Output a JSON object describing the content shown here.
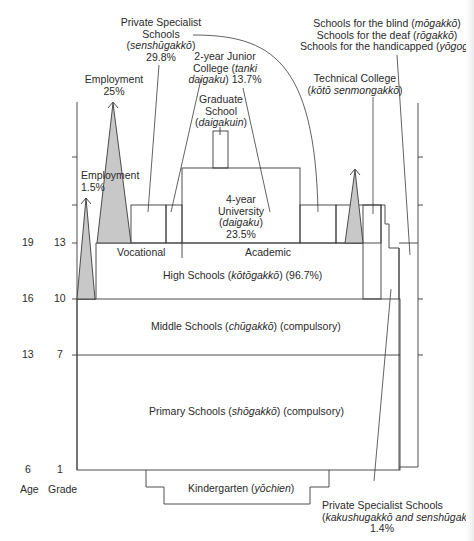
{
  "diagram": {
    "axis": {
      "age_label": "Age",
      "grade_label": "Grade",
      "rows": [
        {
          "age": "19",
          "grade": "13"
        },
        {
          "age": "16",
          "grade": "10"
        },
        {
          "age": "13",
          "grade": "7"
        },
        {
          "age": "6",
          "grade": "1"
        }
      ]
    },
    "labels": {
      "private_specialist_top": {
        "line1": "Private Specialist",
        "line2": "Schools",
        "line3_pre": "(",
        "line3_it": "senshūgakkō",
        "line3_post": ")",
        "line4": "29.8%"
      },
      "junior_college": {
        "line1": "2-year Junior",
        "line2_pre": "College (",
        "line2_it": "tanki",
        "line3_it": "daigaku",
        "line3_post": ") 13.7%"
      },
      "graduate_school": {
        "line1": "Graduate",
        "line2": "School",
        "line3_pre": "(",
        "line3_it": "daigakuin",
        "line3_post": ")"
      },
      "employment_25": {
        "line1": "Employment",
        "line2": "25%"
      },
      "employment_1_5": {
        "line1": "Employment",
        "line2": "1.5%"
      },
      "university": {
        "line1": "4-year",
        "line2": "University",
        "line3_pre": "(",
        "line3_it": "daigaku",
        "line3_post": ")",
        "line4": "23.5%"
      },
      "special_schools": {
        "blind_pre": "Schools for the blind (",
        "blind_it": "mōgakkō",
        "blind_post": ")",
        "deaf_pre": "Schools for the deaf (",
        "deaf_it": "rōgakkō",
        "deaf_post": ")",
        "handicapped_pre": "Schools for the handicapped (",
        "handicapped_it": "yōgogakkō",
        "handicapped_post": ")"
      },
      "technical_college": {
        "line1": "Technical College",
        "line2_pre": "(",
        "line2_it": "kōtō senmongakkō",
        "line2_post": ")"
      },
      "vocational": "Vocational",
      "academic": "Academic",
      "high_schools": {
        "pre": "High Schools (",
        "it": "kōtōgakkō",
        "post": ") (96.7%)"
      },
      "middle_schools": {
        "pre": "Middle Schools (",
        "it": "chūgakkō",
        "post": ") (compulsory)"
      },
      "primary_schools": {
        "pre": "Primary Schools (",
        "it": "shōgakkō",
        "post": ") (compulsory)"
      },
      "kindergarten": {
        "pre": "Kindergarten (",
        "it": "yōchien",
        "post": ")"
      },
      "private_specialist_bottom": {
        "line1": "Private Specialist Schools",
        "line2_pre": "(",
        "line2_it": "kakushugakkō and senshūgakkō",
        "line2_post": ")",
        "line3": "1.4%"
      }
    },
    "colors": {
      "line": "#3a3a3a",
      "triangle_fill": "#c8c8c8",
      "background": "#ffffff"
    }
  }
}
